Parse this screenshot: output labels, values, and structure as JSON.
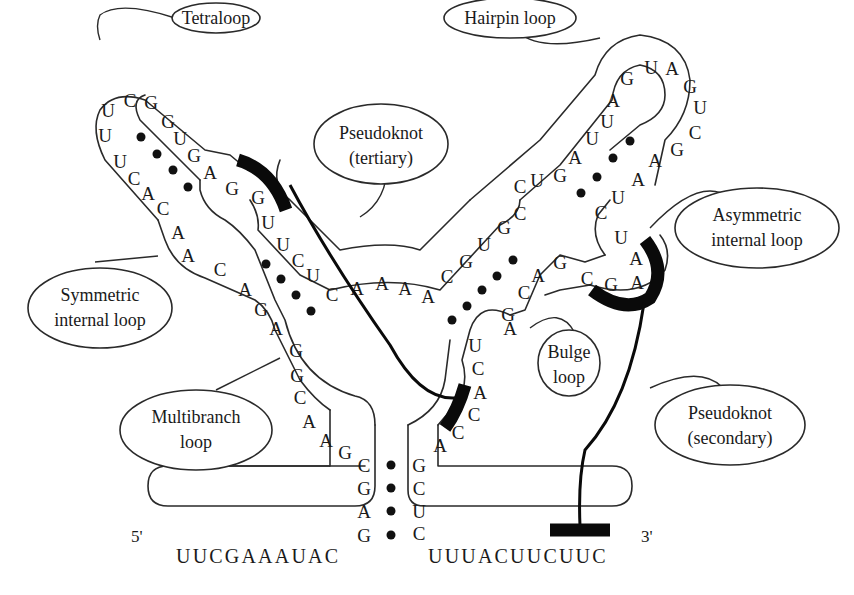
{
  "figure": {
    "strand_ends": {
      "five_prime": "5'",
      "three_prime": "3'"
    },
    "five_prime_tail": "UUCGAAAUAC",
    "three_prime_tail": "UUUACUUCUUC",
    "labels": {
      "tetraloop": "Tetraloop",
      "hairpin_loop": "Hairpin loop",
      "pseudoknot_tertiary_line1": "Pseudoknot",
      "pseudoknot_tertiary_line2": "(tertiary)",
      "asymmetric_line1": "Asymmetric",
      "asymmetric_line2": "internal loop",
      "symmetric_line1": "Symmetric",
      "symmetric_line2": "internal loop",
      "bulge_line1": "Bulge",
      "bulge_line2": "loop",
      "multibranch_line1": "Multibranch",
      "multibranch_line2": "loop",
      "pseudoknot_secondary_line1": "Pseudoknot",
      "pseudoknot_secondary_line2": "(secondary)"
    },
    "nucleotides": {
      "stem_left_5p": [
        "C",
        "G",
        "A",
        "G"
      ],
      "stem_left_3p": [
        "G",
        "C",
        "U",
        "C"
      ],
      "multibranch_left": [
        "G",
        "A",
        "A",
        "C",
        "G"
      ],
      "left_arm_5p": [
        "G",
        "A",
        "G",
        "A",
        "C",
        "A",
        "A"
      ],
      "left_hairpin_5p": [
        "U",
        "C",
        "A",
        "C",
        "U"
      ],
      "tetraloop": [
        "U",
        "U",
        "C",
        "G"
      ],
      "left_hairpin_3p": [
        "G",
        "U",
        "G",
        "A",
        "G"
      ],
      "left_arm_3p": [
        "G",
        "U",
        "U",
        "C",
        "U",
        "C"
      ],
      "junction": [
        "A",
        "A",
        "A",
        "A"
      ],
      "right_arm_5p": [
        "C",
        "G",
        "U",
        "G",
        "C"
      ],
      "right_hairpin_5p": [
        "C",
        "U",
        "G",
        "A",
        "U",
        "U",
        "A"
      ],
      "hairpin_loop": [
        "G",
        "U",
        "A",
        "G",
        "U",
        "C"
      ],
      "right_hairpin_3p": [
        "G",
        "A",
        "A",
        "U",
        "C",
        "U"
      ],
      "asymmetric_loop": [
        "A",
        "A"
      ],
      "right_arm_3p": [
        "G",
        "C",
        "G",
        "A",
        "C",
        "G",
        "A"
      ],
      "bulge_lower": [
        "U",
        "C",
        "A",
        "C",
        "C",
        "A"
      ]
    }
  }
}
